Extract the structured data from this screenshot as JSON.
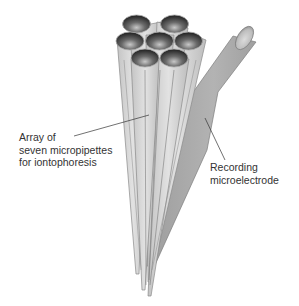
{
  "diagram": {
    "labels": {
      "array": {
        "line1": "Array of",
        "line2": "seven micropipettes",
        "line3": "for iontophoresis"
      },
      "recording": {
        "line1": "Recording",
        "line2": "microelectrode"
      }
    },
    "components": [
      {
        "name": "micropipette-array",
        "count": 7,
        "arrangement": "hexagonal bundle, tapering to tips"
      },
      {
        "name": "recording-microelectrode",
        "count": 1,
        "arrangement": "angled barrel joining bundle, tapering to single tip"
      }
    ],
    "colors": {
      "barrel": "#d4d4d4",
      "barrel_edge": "#8a8a8a",
      "electrode": "#a9a9a9",
      "bore_dark": "#3a3a3a",
      "text": "#333333"
    }
  }
}
